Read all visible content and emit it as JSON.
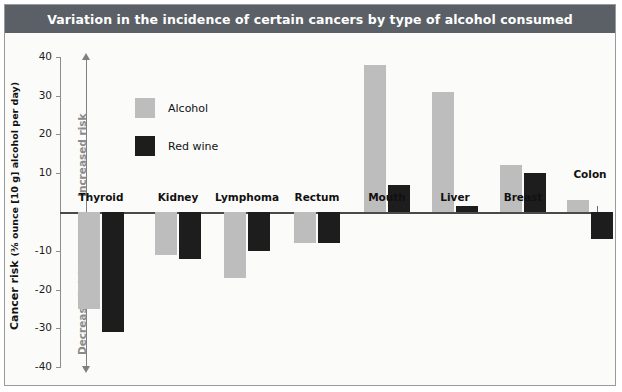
{
  "title": "Variation in the incidence of certain cancers by type of alcohol consumed",
  "legend": {
    "items": [
      {
        "label": "Alcohol",
        "color": "#bdbdbd",
        "key": "alcohol"
      },
      {
        "label": "Red wine",
        "color": "#1d1d1d",
        "key": "redwine"
      }
    ]
  },
  "axis": {
    "y_title_main": "Cancer risk ",
    "y_title_unit": "(⅜ ounce [10 g] alcohol per day)",
    "ticks": [
      "40",
      "30",
      "20",
      "10",
      "",
      "-10",
      "-20",
      "-30",
      "-40"
    ],
    "increased_risk": "Increased risk",
    "decreased_risk": "Decreased risk"
  },
  "colors": {
    "title_bar": "#5a6066",
    "title_text": "#ffffff",
    "alcohol": "#bdbdbd",
    "red_wine": "#1d1d1d",
    "plot_background": "#fbfbfa",
    "axis": "#8d8d8d",
    "risk_text": "#8a8a8a"
  },
  "chart_data": {
    "type": "bar",
    "title": "Variation in the incidence of certain cancers by type of alcohol consumed",
    "xlabel": "",
    "ylabel": "Cancer risk (⅜ ounce [10 g] alcohol per day)",
    "ylim": [
      -40,
      40
    ],
    "yticks": [
      -40,
      -30,
      -20,
      -10,
      0,
      10,
      20,
      30,
      40
    ],
    "grid": false,
    "legend_position": "upper-left-inside",
    "categories": [
      "Thyroid",
      "Kidney",
      "Lymphoma",
      "Rectum",
      "Mouth",
      "Liver",
      "Breast",
      "Colon"
    ],
    "series": [
      {
        "name": "Alcohol",
        "color": "#bdbdbd",
        "values": [
          -25,
          -11,
          -17,
          -8,
          38,
          31,
          12,
          3
        ]
      },
      {
        "name": "Red wine",
        "color": "#1d1d1d",
        "values": [
          -31,
          -12,
          -10,
          -8,
          7,
          1.5,
          10,
          -7
        ]
      }
    ],
    "annotations": [
      "Increased risk",
      "Decreased risk"
    ]
  },
  "bars": [
    {
      "category": "Thyroid",
      "label_above": false,
      "group_x": 78,
      "alcohol": -25,
      "red_wine": -31
    },
    {
      "category": "Kidney",
      "label_above": false,
      "group_x": 155,
      "alcohol": -11,
      "red_wine": -12
    },
    {
      "category": "Lymphoma",
      "label_above": false,
      "group_x": 224,
      "alcohol": -17,
      "red_wine": -10
    },
    {
      "category": "Rectum",
      "label_above": false,
      "group_x": 294,
      "alcohol": -8,
      "red_wine": -8
    },
    {
      "category": "Mouth",
      "label_above": false,
      "group_x": 364,
      "alcohol": 38,
      "red_wine": 7
    },
    {
      "category": "Liver",
      "label_above": false,
      "group_x": 432,
      "alcohol": 31,
      "red_wine": 1.5
    },
    {
      "category": "Breast",
      "label_above": false,
      "group_x": 500,
      "alcohol": 12,
      "red_wine": 10
    },
    {
      "category": "Colon",
      "label_above": true,
      "group_x": 567,
      "alcohol": 3,
      "red_wine": -7
    }
  ]
}
